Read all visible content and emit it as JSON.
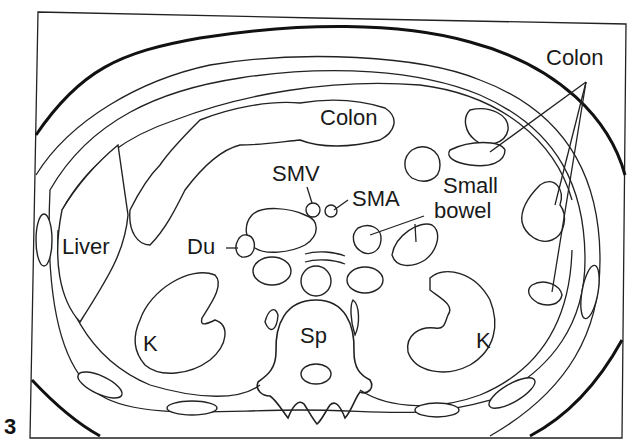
{
  "figure": {
    "number": "3",
    "colors": {
      "line": "#222222",
      "background": "#ffffff"
    }
  },
  "labels": {
    "colon_top": "Colon",
    "colon_right": "Colon",
    "smv": "SMV",
    "sma": "SMA",
    "small_bowel_line1": "Small",
    "small_bowel_line2": "bowel",
    "liver": "Liver",
    "du": "Du",
    "kidney_left": "K",
    "kidney_right": "K",
    "spine": "Sp"
  }
}
